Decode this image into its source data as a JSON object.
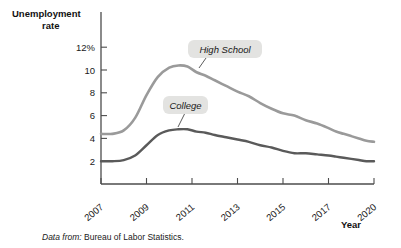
{
  "figure": {
    "y_axis_title_line1": "Unemployment",
    "y_axis_title_line2": "rate",
    "x_axis_title": "Year",
    "source_prefix": "Data from:",
    "source_text": "Bureau of Labor Statistics."
  },
  "chart_data": {
    "type": "line",
    "title": "",
    "xlabel": "Year",
    "ylabel": "Unemployment rate",
    "ylim": [
      0,
      12
    ],
    "xlim": [
      2007,
      2020
    ],
    "grid": false,
    "legend": "inline-callouts",
    "y_ticks": [
      "12%",
      "10",
      "8",
      "6",
      "4",
      "2"
    ],
    "y_tick_values": [
      12,
      10,
      8,
      6,
      4,
      2
    ],
    "x_ticks": [
      "2007",
      "2009",
      "2011",
      "2013",
      "2015",
      "2017",
      "2020"
    ],
    "x_tick_values": [
      2007,
      2009,
      2011,
      2013,
      2015,
      2017,
      2020
    ],
    "colors": {
      "high_school": "#9a9a9a",
      "college": "#5a5a5a",
      "axis": "#4c4c4c",
      "callout_bg": "#e3e3e1"
    },
    "series": [
      {
        "name": "High School",
        "color": "#9a9a9a",
        "x": [
          2007,
          2007.5,
          2008,
          2008.5,
          2009,
          2009.5,
          2010,
          2010.4,
          2010.8,
          2011.2,
          2011.6,
          2012,
          2012.5,
          2013,
          2013.5,
          2014,
          2014.5,
          2015,
          2015.5,
          2016,
          2016.5,
          2017,
          2017.5,
          2018,
          2018.5,
          2019,
          2019.5,
          2020
        ],
        "values": [
          4.4,
          4.4,
          4.7,
          5.8,
          7.8,
          9.4,
          10.2,
          10.4,
          10.3,
          9.8,
          9.5,
          9.1,
          8.6,
          8.1,
          7.7,
          7.1,
          6.6,
          6.2,
          6.0,
          5.6,
          5.3,
          4.9,
          4.6,
          4.4,
          4.2,
          4.0,
          3.8,
          3.7
        ]
      },
      {
        "name": "College",
        "color": "#5a5a5a",
        "x": [
          2007,
          2007.5,
          2008,
          2008.5,
          2009,
          2009.5,
          2010,
          2010.4,
          2010.8,
          2011.2,
          2011.6,
          2012,
          2012.5,
          2013,
          2013.5,
          2014,
          2014.5,
          2015,
          2015.5,
          2016,
          2016.5,
          2017,
          2017.5,
          2018,
          2018.5,
          2019,
          2019.5,
          2020
        ],
        "values": [
          2.0,
          2.0,
          2.1,
          2.5,
          3.4,
          4.3,
          4.7,
          4.8,
          4.8,
          4.6,
          4.5,
          4.3,
          4.1,
          3.9,
          3.7,
          3.4,
          3.2,
          2.9,
          2.7,
          2.7,
          2.6,
          2.5,
          2.4,
          2.3,
          2.2,
          2.1,
          2.0,
          2.0
        ]
      }
    ],
    "annotations": [
      {
        "text": "High School",
        "series": "High School",
        "box_x": 188,
        "box_y": 40
      },
      {
        "text": "College",
        "series": "College",
        "box_x": 163,
        "box_y": 97
      }
    ]
  }
}
